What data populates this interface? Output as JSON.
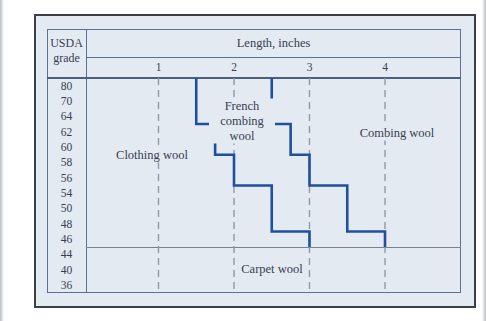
{
  "figure": {
    "grade_header_line1": "USDA",
    "grade_header_line2": "grade"
  },
  "colors": {
    "line_blue": "#1e4fa0",
    "panel": "#e4eaf2",
    "border": "#5d6f93",
    "border_dark": "#4d5f80",
    "text": "#37404f",
    "dash": "#8f99a8",
    "frame": "#3c4045",
    "carpet_line": "#77828f"
  },
  "chart_data": {
    "type": "step-region-chart",
    "xlabel": "Length, inches",
    "ylabel": "USDA grade",
    "x_ticks": [
      "1",
      "2",
      "3",
      "4"
    ],
    "x_range_inches": [
      0,
      5
    ],
    "grades": [
      "80",
      "70",
      "64",
      "62",
      "60",
      "58",
      "56",
      "54",
      "50",
      "48",
      "46",
      "44",
      "40",
      "36"
    ],
    "carpet_grades": [
      "44",
      "40",
      "36"
    ],
    "region_labels": [
      "Clothing wool",
      "French combing wool",
      "Combing wool",
      "Carpet wool"
    ],
    "grid": "dashed-vertical-at-each-inch",
    "boundaries": {
      "clothing_vs_french": [
        {
          "length_in": 1.5,
          "grade_rows": [
            "80",
            "70",
            "64"
          ]
        },
        {
          "length_in": 1.75,
          "grade_rows": [
            "62",
            "60"
          ]
        },
        {
          "length_in": 2.0,
          "grade_rows": [
            "58",
            "56"
          ]
        },
        {
          "length_in": 2.5,
          "grade_rows": [
            "54",
            "50",
            "48"
          ]
        },
        {
          "length_in": 3.0,
          "grade_rows": [
            "46"
          ]
        }
      ],
      "french_vs_combing": [
        {
          "length_in": 2.5,
          "grade_rows": [
            "80",
            "70",
            "64"
          ]
        },
        {
          "length_in": 2.75,
          "grade_rows": [
            "62",
            "60"
          ]
        },
        {
          "length_in": 3.0,
          "grade_rows": [
            "58",
            "56"
          ]
        },
        {
          "length_in": 3.5,
          "grade_rows": [
            "54",
            "50",
            "48"
          ]
        },
        {
          "length_in": 4.0,
          "grade_rows": [
            "46"
          ]
        }
      ],
      "carpet_boundary_below_grade": "46"
    }
  }
}
